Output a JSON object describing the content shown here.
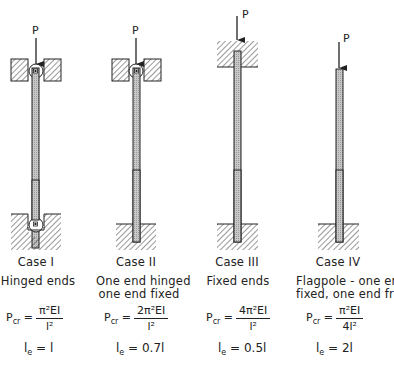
{
  "load_label": "P",
  "cases": [
    {
      "id": "case-1",
      "title": "Case I",
      "description": [
        "Hinged ends"
      ],
      "formula": {
        "lhs": "P",
        "lhs_sub": "cr",
        "eq": "=",
        "numerator": "π²EI",
        "denominator": "l²"
      },
      "effective_length": {
        "symbol": "l",
        "sub": "e",
        "eq": "=",
        "value": "l"
      },
      "top_support": "hinged",
      "bottom_support": "hinged"
    },
    {
      "id": "case-2",
      "title": "Case II",
      "description": [
        "One end hinged",
        "one end fixed"
      ],
      "formula": {
        "lhs": "P",
        "lhs_sub": "cr",
        "eq": "=",
        "numerator": "2π²EI",
        "denominator": "l²"
      },
      "effective_length": {
        "symbol": "l",
        "sub": "e",
        "eq": "=",
        "value": "0.7l"
      },
      "top_support": "hinged",
      "bottom_support": "fixed"
    },
    {
      "id": "case-3",
      "title": "Case III",
      "description": [
        "Fixed ends"
      ],
      "formula": {
        "lhs": "P",
        "lhs_sub": "cr",
        "eq": "=",
        "numerator": "4π²EI",
        "denominator": "l²"
      },
      "effective_length": {
        "symbol": "l",
        "sub": "e",
        "eq": "=",
        "value": "0.5l"
      },
      "top_support": "fixed",
      "bottom_support": "fixed"
    },
    {
      "id": "case-4",
      "title": "Case IV",
      "description": [
        "Flagpole - one end",
        "fixed, one end free"
      ],
      "formula": {
        "lhs": "P",
        "lhs_sub": "cr",
        "eq": "=",
        "numerator": "π²EI",
        "denominator": "4l²"
      },
      "effective_length": {
        "symbol": "l",
        "sub": "e",
        "eq": "=",
        "value": "2l"
      },
      "top_support": "free",
      "bottom_support": "fixed"
    }
  ],
  "colors": {
    "line": "#222222",
    "column_fill": "#bdbdbd",
    "hatch": "#333333",
    "background": "#ffffff"
  }
}
